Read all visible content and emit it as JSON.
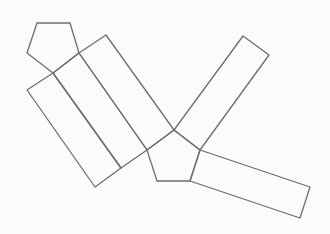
{
  "diagram": {
    "title": "",
    "stroke_color": "#6e6e6e",
    "background_color": "#fbfbfb",
    "shapes": [
      {
        "id": "pentagon-top-left",
        "kind": "pentagon"
      },
      {
        "id": "rect-band-1",
        "kind": "rectangle"
      },
      {
        "id": "rect-band-2",
        "kind": "rectangle"
      },
      {
        "id": "rect-band-3",
        "kind": "rectangle"
      },
      {
        "id": "pentagon-center",
        "kind": "pentagon"
      },
      {
        "id": "rect-upper-right",
        "kind": "rectangle"
      },
      {
        "id": "rect-lower-right",
        "kind": "rectangle"
      }
    ]
  }
}
